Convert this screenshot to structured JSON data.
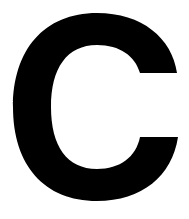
{
  "glyph": {
    "character": "C",
    "color": "#000000",
    "background": "#ffffff"
  }
}
